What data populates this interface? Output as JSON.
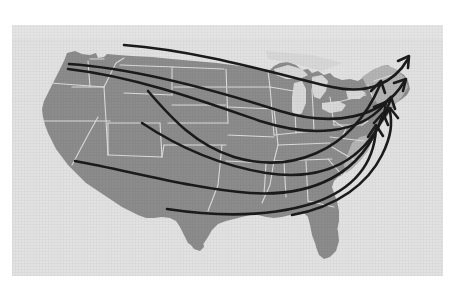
{
  "figure": {
    "kind": "map",
    "region": "United States",
    "title": "",
    "caption": "",
    "background_color": "#e2e2e2",
    "page_color": "#ffffff",
    "land_color": "#8c8c8c",
    "lake_color": "#d8d8d8",
    "border_color": "#dcdcdc",
    "arrow_color": "#1b1b1b",
    "panel": {
      "x": 12,
      "y": 25,
      "width": 431,
      "height": 251
    }
  },
  "legend": {
    "present": false,
    "items": []
  },
  "labels": {
    "present": false,
    "items": []
  },
  "map": {
    "name": "contiguous-united-states",
    "state_borders_visible": true,
    "great_lakes_visible": true,
    "projection_note": "albers-like"
  },
  "flows": {
    "count": 7,
    "direction": "west-to-east",
    "arrowhead": "open-v",
    "items": [
      {
        "id": "flow-1",
        "from": "Pacific Northwest",
        "to": "Northern New England",
        "label": ""
      },
      {
        "id": "flow-2",
        "from": "Pacific Northwest",
        "to": "New England",
        "label": ""
      },
      {
        "id": "flow-3",
        "from": "Northern Rockies",
        "to": "Mid-Atlantic North",
        "label": ""
      },
      {
        "id": "flow-4",
        "from": "Great Basin",
        "to": "Mid-Atlantic",
        "label": ""
      },
      {
        "id": "flow-5",
        "from": "Southern California",
        "to": "Mid-Atlantic South",
        "label": ""
      },
      {
        "id": "flow-6",
        "from": "West Texas",
        "to": "Southeast Coast",
        "label": ""
      },
      {
        "id": "flow-7",
        "from": "Gulf Coast",
        "to": "Atlantic Coast",
        "label": ""
      }
    ]
  },
  "chart_data": {
    "type": "map",
    "title": "",
    "xlabel": "",
    "ylabel": "",
    "series": [
      {
        "name": "flow-1",
        "origin": "Pacific Northwest",
        "destination": "Northern New England",
        "path": "M 56 30 C 140 40, 255 60, 330 74 C 368 82, 390 70, 404 46"
      },
      {
        "name": "flow-2",
        "origin": "Pacific Northwest Coast",
        "destination": "New England",
        "path": "M 58 47 C 130 58, 220 85, 282 100 C 330 112, 372 98, 398 62"
      },
      {
        "name": "flow-3",
        "origin": "Northern Rockies",
        "destination": "Mid-Atlantic North",
        "path": "M 140 67 C 170 96, 198 122, 240 130 C 300 142, 360 122, 392 78"
      },
      {
        "name": "flow-4",
        "origin": "Great Basin",
        "destination": "Mid-Atlantic",
        "path": "M 138 99 C 180 122, 225 140, 280 147 C 330 152, 372 136, 386 92"
      },
      {
        "name": "flow-5",
        "origin": "Southern California",
        "destination": "Mid-Atlantic South",
        "path": "M 63 139 C 120 152, 190 168, 250 172 C 312 175, 362 154, 380 106"
      },
      {
        "name": "flow-6",
        "origin": "West Texas",
        "destination": "Southeast Coast",
        "path": "M 156 188 C 210 196, 262 198, 308 186 C 348 173, 368 146, 370 118"
      },
      {
        "name": "flow-7",
        "origin": "Gulf Coast",
        "destination": "Atlantic Coast",
        "path": "M 282 194 C 330 186, 362 164, 376 136 C 386 116, 386 100, 384 88"
      }
    ],
    "layout": {
      "grid": false,
      "legend_position": "none",
      "axes": false
    }
  }
}
